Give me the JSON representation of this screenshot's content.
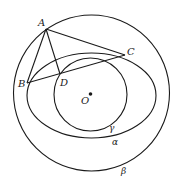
{
  "diagram": {
    "width": 178,
    "height": 186,
    "stroke_color": "#1a1a1a",
    "background": "#ffffff",
    "curves": {
      "beta": {
        "type": "circle",
        "cx": 91.5,
        "cy": 93,
        "r": 78,
        "label": "β",
        "label_x": 121,
        "label_y": 174
      },
      "alpha": {
        "type": "ellipse",
        "cx": 91.5,
        "cy": 95.5,
        "rx": 64.5,
        "ry": 42.5,
        "label": "α",
        "label_x": 112,
        "label_y": 145
      },
      "gamma": {
        "type": "circle",
        "cx": 90.5,
        "cy": 94.5,
        "r": 36.5,
        "label": "γ",
        "label_x": 109,
        "label_y": 131
      }
    },
    "points": {
      "A": {
        "x": 46,
        "y": 29,
        "label": "A",
        "label_x": 38,
        "label_y": 26
      },
      "B": {
        "x": 27,
        "y": 83,
        "label": "B",
        "label_x": 18,
        "label_y": 87
      },
      "C": {
        "x": 125,
        "y": 55,
        "label": "C",
        "label_x": 127,
        "label_y": 55
      },
      "D": {
        "x": 60,
        "y": 74,
        "label": "D",
        "label_x": 60,
        "label_y": 86
      },
      "O": {
        "x": 90.5,
        "y": 94,
        "label": "O",
        "label_x": 81,
        "label_y": 104
      }
    },
    "segments": [
      {
        "from": "A",
        "to": "B"
      },
      {
        "from": "A",
        "to": "C"
      },
      {
        "from": "A",
        "to": "D"
      },
      {
        "from": "B",
        "to": "C"
      }
    ]
  }
}
